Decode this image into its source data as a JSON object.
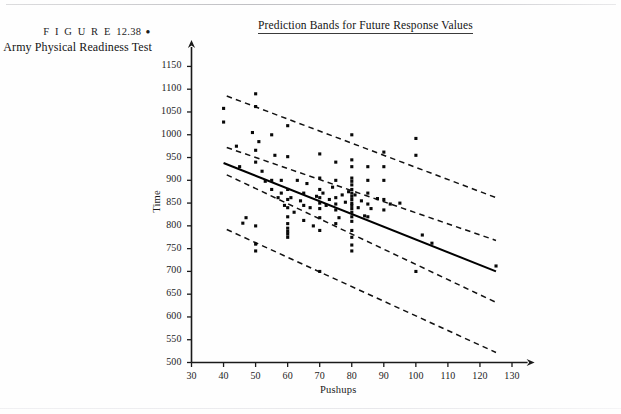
{
  "caption": {
    "figure_word": "F I G U R E",
    "figure_number": "12.38",
    "bullet": "●",
    "title": "Army Physical Readiness Test"
  },
  "plot_title": "Prediction Bands for Future Response Values",
  "chart_data": {
    "type": "scatter",
    "title": "Prediction Bands for Future Response Values",
    "xlabel": "Pushups",
    "ylabel": "Time",
    "xlim": [
      30,
      133
    ],
    "ylim": [
      500,
      1175
    ],
    "xticks": [
      30,
      40,
      50,
      60,
      70,
      80,
      90,
      100,
      110,
      120,
      130
    ],
    "yticks": [
      500,
      550,
      600,
      650,
      700,
      750,
      800,
      850,
      900,
      950,
      1000,
      1050,
      1100,
      1150
    ],
    "grid": false,
    "legend": null,
    "axis_arrows": true,
    "points": [
      [
        40,
        1058
      ],
      [
        40,
        1028
      ],
      [
        44,
        975
      ],
      [
        45,
        930
      ],
      [
        46,
        806
      ],
      [
        47,
        818
      ],
      [
        49,
        1005
      ],
      [
        50,
        1090
      ],
      [
        50,
        1062
      ],
      [
        50,
        966
      ],
      [
        50,
        940
      ],
      [
        50,
        800
      ],
      [
        50,
        760
      ],
      [
        50,
        745
      ],
      [
        51,
        985
      ],
      [
        52,
        920
      ],
      [
        53,
        898
      ],
      [
        55,
        1000
      ],
      [
        55,
        900
      ],
      [
        55,
        880
      ],
      [
        56,
        955
      ],
      [
        57,
        862
      ],
      [
        58,
        900
      ],
      [
        58,
        872
      ],
      [
        59,
        845
      ],
      [
        60,
        1020
      ],
      [
        60,
        952
      ],
      [
        60,
        880
      ],
      [
        60,
        858
      ],
      [
        60,
        840
      ],
      [
        60,
        820
      ],
      [
        60,
        805
      ],
      [
        60,
        795
      ],
      [
        60,
        788
      ],
      [
        60,
        782
      ],
      [
        60,
        775
      ],
      [
        61,
        862
      ],
      [
        62,
        830
      ],
      [
        63,
        900
      ],
      [
        64,
        855
      ],
      [
        65,
        872
      ],
      [
        65,
        845
      ],
      [
        65,
        812
      ],
      [
        66,
        893
      ],
      [
        67,
        840
      ],
      [
        68,
        800
      ],
      [
        69,
        865
      ],
      [
        70,
        958
      ],
      [
        70,
        905
      ],
      [
        70,
        880
      ],
      [
        70,
        862
      ],
      [
        70,
        850
      ],
      [
        70,
        838
      ],
      [
        70,
        818
      ],
      [
        70,
        790
      ],
      [
        70,
        700
      ],
      [
        71,
        872
      ],
      [
        72,
        845
      ],
      [
        73,
        858
      ],
      [
        74,
        885
      ],
      [
        75,
        940
      ],
      [
        75,
        900
      ],
      [
        75,
        862
      ],
      [
        75,
        848
      ],
      [
        75,
        835
      ],
      [
        75,
        805
      ],
      [
        76,
        818
      ],
      [
        77,
        868
      ],
      [
        78,
        852
      ],
      [
        79,
        875
      ],
      [
        80,
        1000
      ],
      [
        80,
        945
      ],
      [
        80,
        930
      ],
      [
        80,
        905
      ],
      [
        80,
        898
      ],
      [
        80,
        890
      ],
      [
        80,
        880
      ],
      [
        80,
        872
      ],
      [
        80,
        865
      ],
      [
        80,
        858
      ],
      [
        80,
        850
      ],
      [
        80,
        845
      ],
      [
        80,
        838
      ],
      [
        80,
        830
      ],
      [
        80,
        820
      ],
      [
        80,
        810
      ],
      [
        80,
        790
      ],
      [
        80,
        775
      ],
      [
        80,
        758
      ],
      [
        80,
        745
      ],
      [
        81,
        868
      ],
      [
        82,
        840
      ],
      [
        83,
        855
      ],
      [
        84,
        822
      ],
      [
        85,
        930
      ],
      [
        85,
        900
      ],
      [
        85,
        872
      ],
      [
        85,
        848
      ],
      [
        85,
        820
      ],
      [
        86,
        838
      ],
      [
        88,
        860
      ],
      [
        90,
        962
      ],
      [
        90,
        930
      ],
      [
        90,
        900
      ],
      [
        90,
        858
      ],
      [
        90,
        835
      ],
      [
        92,
        848
      ],
      [
        95,
        850
      ],
      [
        100,
        992
      ],
      [
        100,
        955
      ],
      [
        100,
        700
      ],
      [
        102,
        780
      ],
      [
        105,
        762
      ],
      [
        125,
        712
      ]
    ],
    "regression_line": {
      "x": [
        40,
        125
      ],
      "y": [
        938,
        700
      ],
      "style": "solid"
    },
    "bands": [
      {
        "name": "upper-outer-prediction-band",
        "x": [
          41,
          125
        ],
        "y": [
          1085,
          862
        ],
        "style": "dashed"
      },
      {
        "name": "upper-inner-confidence-band",
        "x": [
          41,
          125
        ],
        "y": [
          972,
          768
        ],
        "style": "dashed"
      },
      {
        "name": "lower-inner-confidence-band",
        "x": [
          41,
          125
        ],
        "y": [
          912,
          632
        ],
        "style": "dashed"
      },
      {
        "name": "lower-outer-prediction-band",
        "x": [
          41,
          125
        ],
        "y": [
          792,
          522
        ],
        "style": "dashed"
      }
    ]
  }
}
